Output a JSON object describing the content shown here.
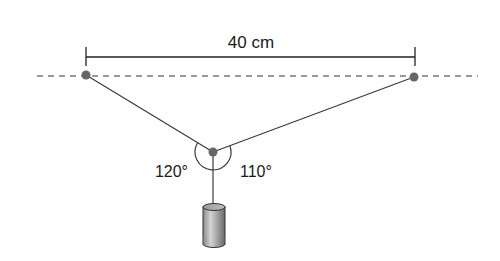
{
  "diagram": {
    "type": "physics-force-diagram",
    "distance_label": "40 cm",
    "angle_left_label": "120°",
    "angle_right_label": "110°",
    "anchors": [
      {
        "name": "left-anchor",
        "x": 86,
        "y": 75
      },
      {
        "name": "right-anchor",
        "x": 414,
        "y": 77
      }
    ],
    "junction": {
      "x": 213,
      "y": 152
    },
    "weight": {
      "shape": "cylinder"
    },
    "colors": {
      "line": "#3a3a3a",
      "point": "#666666",
      "dashed": "#333333"
    }
  }
}
